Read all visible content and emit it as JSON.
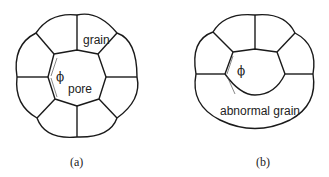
{
  "figure_a": {
    "caption": "(a)",
    "labels": {
      "grain": "grain",
      "pore": "pore",
      "angle": "ϕ"
    }
  },
  "figure_b": {
    "caption": "(b)",
    "labels": {
      "abnormal_grain": "abnormal grain",
      "angle": "ϕ"
    }
  },
  "colors": {
    "stroke": "#1a1a1a",
    "background": "#ffffff"
  }
}
